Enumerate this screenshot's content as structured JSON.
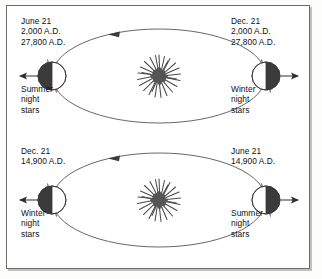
{
  "figure": {
    "type": "axial-precession-diagram",
    "colors": {
      "frame": "#6b6b6b",
      "orbit": "#555555",
      "earth_dark": "#3b3b3b",
      "earth_light": "#ffffff",
      "sun": "#4a4a4a",
      "text": "#111111",
      "background": "#ffffff"
    }
  },
  "panels": [
    {
      "id": "panel-top",
      "left": {
        "date": "June 21",
        "year_1": "2,000 A.D.",
        "year_2": "27,800 A.D.",
        "season_line_1": "Summer",
        "season_line_2": "night",
        "season_line_3": "stars",
        "arrow": "arrow-left",
        "shadow_side": "left"
      },
      "right": {
        "date": "Dec. 21",
        "year_1": "2,000 A.D.",
        "year_2": "27,800 A.D.",
        "season_line_1": "Winter",
        "season_line_2": "night",
        "season_line_3": "stars",
        "arrow": "arrow-right",
        "shadow_side": "right"
      },
      "orbit_direction": "counterclockwise"
    },
    {
      "id": "panel-bottom",
      "left": {
        "date": "Dec. 21",
        "year_1": "14,900 A.D.",
        "year_2": "",
        "season_line_1": "Winter",
        "season_line_2": "night",
        "season_line_3": "stars",
        "arrow": "arrow-left",
        "shadow_side": "left"
      },
      "right": {
        "date": "June 21",
        "year_1": "14,900 A.D.",
        "year_2": "",
        "season_line_1": "Summer",
        "season_line_2": "night",
        "season_line_3": "stars",
        "arrow": "arrow-right",
        "shadow_side": "right"
      },
      "orbit_direction": "counterclockwise"
    }
  ],
  "icons": {
    "sun": "sun-starburst-icon",
    "earth": "earth-globe-icon",
    "axis": "earth-axis-icon",
    "orbit_arrow": "orbit-direction-arrow-icon",
    "direction_arrow_left": "direction-arrow-left-icon",
    "direction_arrow_right": "direction-arrow-right-icon"
  }
}
